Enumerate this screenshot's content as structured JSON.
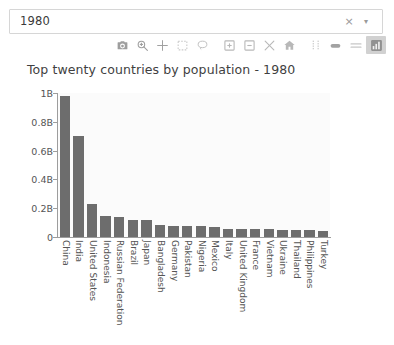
{
  "search": {
    "value": "1980",
    "placeholder": "Select year",
    "clear_label": "×",
    "caret_label": "▾"
  },
  "modebar": {
    "buttons": [
      {
        "name": "download-plot-icon",
        "title": "Download plot as a png",
        "active": false
      },
      {
        "name": "zoom-icon",
        "title": "Zoom",
        "active": false
      },
      {
        "name": "pan-icon",
        "title": "Pan",
        "active": false
      },
      {
        "name": "box-select-icon",
        "title": "Box Select",
        "active": false
      },
      {
        "name": "lasso-select-icon",
        "title": "Lasso Select",
        "active": false
      },
      {
        "name": "zoom-in-icon",
        "title": "Zoom in",
        "active": false
      },
      {
        "name": "zoom-out-icon",
        "title": "Zoom out",
        "active": false
      },
      {
        "name": "autoscale-icon",
        "title": "Autoscale",
        "active": false
      },
      {
        "name": "reset-axes-icon",
        "title": "Reset axes",
        "active": false
      },
      {
        "name": "toggle-spike-lines-icon",
        "title": "Toggle Spike Lines",
        "active": false
      },
      {
        "name": "hover-compare-icon",
        "title": "Show closest data on hover",
        "active": false
      },
      {
        "name": "hover-closest-icon",
        "title": "Compare data on hover",
        "active": false
      },
      {
        "name": "plotly-logo-icon",
        "title": "Produced with Plotly",
        "active": true
      }
    ]
  },
  "chart_data": {
    "type": "bar",
    "title": "Top twenty countries by population - 1980",
    "xlabel": "",
    "ylabel": "",
    "ylim": [
      0,
      1000000000
    ],
    "grid": false,
    "legend": false,
    "orientation": "vertical",
    "bar_color": "#6d6d6d",
    "ytick_labels": [
      "0",
      "0.2B",
      "0.4B",
      "0.6B",
      "0.8B",
      "1B"
    ],
    "ytick_values": [
      0,
      200000000,
      400000000,
      600000000,
      800000000,
      1000000000
    ],
    "categories": [
      "China",
      "India",
      "United States",
      "Indonesia",
      "Russian Federation",
      "Brazil",
      "Japan",
      "Bangladesh",
      "Germany",
      "Pakistan",
      "Nigeria",
      "Mexico",
      "Italy",
      "United Kingdom",
      "France",
      "Vietnam",
      "Ukraine",
      "Thailand",
      "Philippines",
      "Turkey"
    ],
    "values": [
      981235000,
      698952844,
      227225000,
      147447836,
      139039000,
      120694009,
      116807000,
      81364176,
      78288576,
      78054343,
      73461631,
      68347479,
      56434047,
      56314216,
      55284321,
      53714000,
      50047150,
      47026271,
      47063513,
      44089069
    ]
  }
}
